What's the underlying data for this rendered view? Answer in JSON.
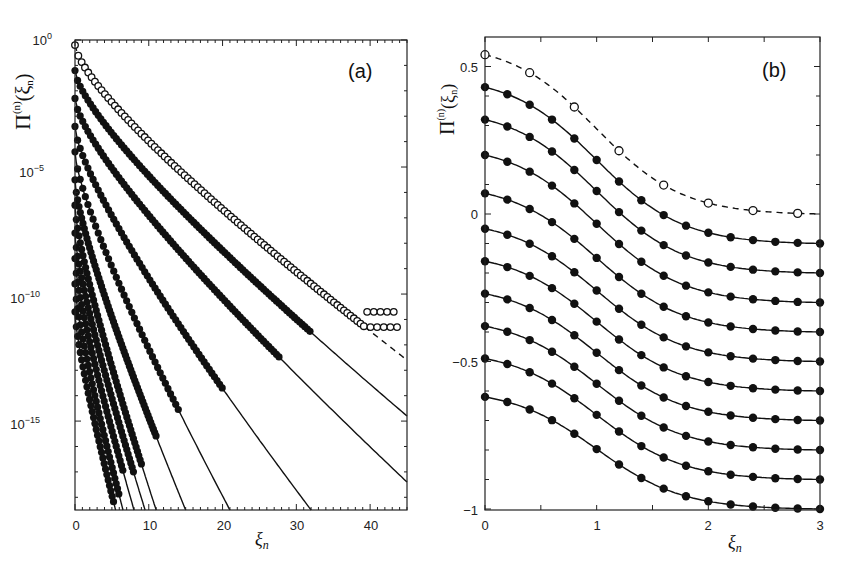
{
  "chart_data": [
    {
      "panel": "(a)",
      "type": "scatter",
      "title": "",
      "xlabel": "ξ_n",
      "ylabel": "Π̂^(n)(ξ_n)",
      "xlim": [
        0,
        45
      ],
      "ylim_log10": [
        -18.5,
        0
      ],
      "yscale": "log",
      "x_ticks": [
        0,
        10,
        20,
        30,
        40
      ],
      "y_ticks": [
        "10^0",
        "10^-5",
        "10^-10",
        "10^-15"
      ],
      "grid": false,
      "series": [
        {
          "name": "open circles (dashed fit)",
          "marker": "open-circle",
          "line": "dashed",
          "start_log10": -0.2,
          "x_end": 45,
          "end_log10": -12.6,
          "noise_floor_log10": -11.3,
          "data_extent_x": 44
        },
        {
          "name": "curve 1",
          "marker": "filled-circle",
          "line": "solid",
          "start_log10": -1.2,
          "x_end": 45,
          "end_log10": -14.8,
          "data_extent_x": 32
        },
        {
          "name": "curve 2",
          "marker": "filled-circle",
          "line": "solid",
          "start_log10": -2.3,
          "x_end": 45,
          "end_log10": -17.4,
          "data_extent_x": 28
        },
        {
          "name": "curve 3",
          "marker": "filled-circle",
          "line": "solid",
          "start_log10": -3.4,
          "x_end": 32,
          "end_log10": -18.5,
          "data_extent_x": 20
        },
        {
          "name": "curve 4",
          "marker": "filled-circle",
          "line": "solid",
          "start_log10": -4.4,
          "x_end": 21,
          "end_log10": -18.5,
          "data_extent_x": 14
        },
        {
          "name": "curve 5",
          "marker": "filled-circle",
          "line": "solid",
          "start_log10": -5.5,
          "x_end": 15,
          "end_log10": -18.5,
          "data_extent_x": 11
        },
        {
          "name": "curve 6",
          "marker": "filled-circle",
          "line": "solid",
          "start_log10": -6.5,
          "x_end": 11,
          "end_log10": -18.5,
          "data_extent_x": 9
        },
        {
          "name": "curve 7",
          "marker": "filled-circle",
          "line": "solid",
          "start_log10": -7.6,
          "x_end": 9.5,
          "end_log10": -18.5,
          "data_extent_x": 8
        },
        {
          "name": "curve 8",
          "marker": "filled-circle",
          "line": "solid",
          "start_log10": -8.6,
          "x_end": 8,
          "end_log10": -18.5,
          "data_extent_x": 6.5
        },
        {
          "name": "curve 9",
          "marker": "filled-circle",
          "line": "solid",
          "start_log10": -9.6,
          "x_end": 6.5,
          "end_log10": -18.5,
          "data_extent_x": 6
        },
        {
          "name": "curve 10",
          "marker": "filled-circle",
          "line": "solid",
          "start_log10": -10.7,
          "x_end": 5.5,
          "end_log10": -18.5,
          "data_extent_x": 5.3
        }
      ]
    },
    {
      "panel": "(b)",
      "type": "line",
      "title": "",
      "xlabel": "ξ_n",
      "ylabel": "Π̂^(n)(ξ_n)",
      "xlim": [
        0,
        3
      ],
      "ylim": [
        -1,
        0.6
      ],
      "x_ticks": [
        0,
        1,
        2,
        3
      ],
      "y_ticks": [
        -1,
        -0.5,
        0,
        0.5
      ],
      "grid": false,
      "x": [
        0,
        0.2,
        0.4,
        0.6,
        0.8,
        1.0,
        1.2,
        1.4,
        1.6,
        1.8,
        2.0,
        2.2,
        2.4,
        2.6,
        2.8,
        3.0
      ],
      "open_x": [
        0,
        0.4,
        0.8,
        1.2,
        1.6,
        2.0,
        2.4,
        2.8
      ],
      "series": [
        {
          "name": "open circles (dashed)",
          "marker": "open-circle",
          "line": "dashed",
          "start": 0.54,
          "end": 0.0
        },
        {
          "name": "curve 1",
          "marker": "filled-circle",
          "line": "solid",
          "start": 0.43,
          "end": -0.1
        },
        {
          "name": "curve 2",
          "marker": "filled-circle",
          "line": "solid",
          "start": 0.32,
          "end": -0.2
        },
        {
          "name": "curve 3",
          "marker": "filled-circle",
          "line": "solid",
          "start": 0.2,
          "end": -0.3
        },
        {
          "name": "curve 4",
          "marker": "filled-circle",
          "line": "solid",
          "start": 0.07,
          "end": -0.4
        },
        {
          "name": "curve 5",
          "marker": "filled-circle",
          "line": "solid",
          "start": -0.05,
          "end": -0.5
        },
        {
          "name": "curve 6",
          "marker": "filled-circle",
          "line": "solid",
          "start": -0.16,
          "end": -0.6
        },
        {
          "name": "curve 7",
          "marker": "filled-circle",
          "line": "solid",
          "start": -0.27,
          "end": -0.7
        },
        {
          "name": "curve 8",
          "marker": "filled-circle",
          "line": "solid",
          "start": -0.38,
          "end": -0.8
        },
        {
          "name": "curve 9",
          "marker": "filled-circle",
          "line": "solid",
          "start": -0.49,
          "end": -0.9
        },
        {
          "name": "curve 10",
          "marker": "filled-circle",
          "line": "solid",
          "start": -0.62,
          "end": -1.0
        }
      ]
    }
  ],
  "panels": {
    "a": {
      "label": "(a)",
      "xlabel": "ξ",
      "xlabel_sub": "n",
      "x_tick_labels": [
        "0",
        "10",
        "20",
        "30",
        "40"
      ],
      "y_tick_bases": [
        "10",
        "10",
        "10",
        "10"
      ],
      "y_tick_exps": [
        "0",
        "−5",
        "−10",
        "−15"
      ],
      "ylabel_main": "Π",
      "ylabel_hat": "^",
      "ylabel_sup": "(n)",
      "ylabel_arg": "(ξ",
      "ylabel_arg_sub": "n",
      "ylabel_close": ")"
    },
    "b": {
      "label": "(b)",
      "xlabel": "ξ",
      "xlabel_sub": "n",
      "x_tick_labels": [
        "0",
        "1",
        "2",
        "3"
      ],
      "y_tick_labels": [
        "0.5",
        "0",
        "−0.5",
        "−1"
      ],
      "ylabel_main": "Π",
      "ylabel_hat": "^",
      "ylabel_sup": "(n)",
      "ylabel_arg": "(ξ",
      "ylabel_arg_sub": "n",
      "ylabel_close": ")"
    }
  }
}
